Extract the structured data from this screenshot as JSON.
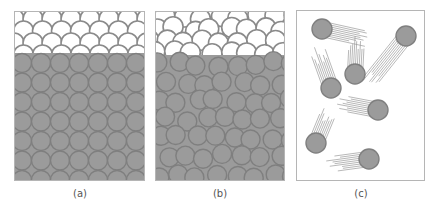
{
  "figure": {
    "panels": [
      {
        "id": "a",
        "label": "(a)",
        "description": "Solid: ordered crystalline lattice of particles (square packing) with regular surface layers above",
        "x": 14,
        "y": 11,
        "width": 131,
        "height": 170,
        "solid_top": 57
      },
      {
        "id": "b",
        "label": "(b)",
        "description": "Liquid: disordered, closely packed particles",
        "x": 155,
        "y": 11,
        "width": 130,
        "height": 170,
        "solid_top": 58
      },
      {
        "id": "c",
        "label": "(c)",
        "description": "Gas: widely spaced, fast-moving particles with motion trails",
        "x": 296,
        "y": 10,
        "width": 129,
        "height": 171,
        "particles": [
          {
            "cx": 322,
            "cy": 29,
            "trail_dx": 45,
            "trail_dy": 10
          },
          {
            "cx": 406,
            "cy": 36,
            "trail_dx": -40,
            "trail_dy": 50
          },
          {
            "cx": 355,
            "cy": 74,
            "trail_dx": 2,
            "trail_dy": -38
          },
          {
            "cx": 331,
            "cy": 88,
            "trail_dx": -15,
            "trail_dy": -42
          },
          {
            "cx": 378,
            "cy": 110,
            "trail_dx": -42,
            "trail_dy": -8
          },
          {
            "cx": 316,
            "cy": 143,
            "trail_dx": 14,
            "trail_dy": -34
          },
          {
            "cx": 369,
            "cy": 159,
            "trail_dx": -44,
            "trail_dy": 6
          }
        ]
      }
    ],
    "colors": {
      "particle_fill": "#9b9b9b",
      "particle_stroke": "#7f7f7f",
      "panel_border": "#b5b5b5",
      "outline_circle_stroke": "#8a8a8a",
      "trail": "#9a9a9a",
      "label": "#555555"
    },
    "particle_radius": 10
  }
}
